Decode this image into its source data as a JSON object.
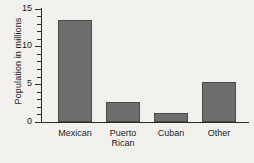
{
  "chart_data": {
    "type": "bar",
    "title": "",
    "xlabel": "",
    "ylabel": "Population in millions",
    "categories": [
      "Mexican",
      "Puerto Rican",
      "Cuban",
      "Other"
    ],
    "values": [
      13.5,
      2.7,
      1.2,
      5.3
    ],
    "ylim": [
      0,
      15
    ],
    "y_ticks": [
      0,
      5,
      10,
      15
    ],
    "y_tick_labels": [
      "0",
      "5",
      "10",
      "15"
    ],
    "y_minor_tick_step": 1,
    "grid": false,
    "legend": null,
    "bar_color": "#6e6e6e",
    "bar_edge_color": "#4a4a4a",
    "axis_color": "#2a2a2a",
    "background_color": "#f2f1ee"
  },
  "axis": {
    "y_title": "Population in millions",
    "tick_labels": [
      {
        "value": 15,
        "text": "15"
      },
      {
        "value": 10,
        "text": "10"
      },
      {
        "value": 5,
        "text": "5"
      },
      {
        "value": 0,
        "text": "0"
      }
    ]
  },
  "categories": [
    {
      "label": "Mexican",
      "value": 13.5
    },
    {
      "label": "Puerto\nRican",
      "value": 2.7
    },
    {
      "label": "Cuban",
      "value": 1.2
    },
    {
      "label": "Other",
      "value": 5.3
    }
  ]
}
